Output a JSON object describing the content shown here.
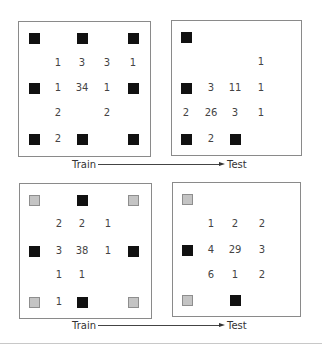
{
  "colors": {
    "black_marker": "#111111",
    "gray_marker": "#c4c4c4",
    "border": "#8a8a8a"
  },
  "rows": [
    {
      "train_label": "Train",
      "test_label": "Test",
      "train": {
        "box": [
          18,
          21,
          133,
          136
        ],
        "cols": [
          34,
          58,
          82,
          107,
          133
        ],
        "rows": [
          38,
          63,
          88,
          113,
          139
        ],
        "cells": [
          [
            "B",
            "",
            "B",
            "",
            "B"
          ],
          [
            "",
            "1",
            "3",
            "3",
            "1"
          ],
          [
            "B",
            "1",
            "34",
            "1",
            "B"
          ],
          [
            "",
            "2",
            "",
            "2",
            ""
          ],
          [
            "B",
            "2",
            "B",
            "",
            "B"
          ]
        ]
      },
      "test": {
        "box": [
          171,
          20,
          131,
          136
        ],
        "cols": [
          186,
          211,
          235,
          261
        ],
        "rows": [
          37,
          62,
          88,
          113,
          139
        ],
        "cells": [
          [
            "B",
            "",
            "",
            ""
          ],
          [
            "",
            "",
            "",
            "1"
          ],
          [
            "B",
            "3",
            "11",
            "1"
          ],
          [
            "2",
            "26",
            "3",
            "1"
          ],
          [
            "B",
            "2",
            "B",
            ""
          ]
        ]
      }
    },
    {
      "train_label": "Train",
      "test_label": "Test",
      "train": {
        "box": [
          19,
          183,
          133,
          136
        ],
        "cols": [
          34,
          59,
          82,
          108,
          133
        ],
        "rows": [
          200,
          224,
          251,
          275,
          302
        ],
        "cells": [
          [
            "G",
            "",
            "B",
            "",
            "G"
          ],
          [
            "",
            "2",
            "2",
            "1",
            ""
          ],
          [
            "B",
            "3",
            "38",
            "1",
            "B"
          ],
          [
            "",
            "1",
            "1",
            "",
            ""
          ],
          [
            "G",
            "1",
            "B",
            "",
            "G"
          ]
        ]
      },
      "test": {
        "box": [
          172,
          182,
          129,
          135
        ],
        "cols": [
          187,
          211,
          235,
          262
        ],
        "rows": [
          199,
          224,
          250,
          275,
          300
        ],
        "cells": [
          [
            "G",
            "",
            "",
            ""
          ],
          [
            "",
            "1",
            "2",
            "2"
          ],
          [
            "B",
            "4",
            "29",
            "3"
          ],
          [
            "",
            "6",
            "1",
            "2"
          ],
          [
            "G",
            "",
            "B",
            ""
          ]
        ]
      }
    }
  ],
  "arrows": [
    {
      "train_x": 72,
      "text_y": 159,
      "line_x1": 98,
      "line_x2": 219,
      "line_y": 164,
      "test_x": 227
    },
    {
      "train_x": 72,
      "text_y": 320,
      "line_x1": 98,
      "line_x2": 219,
      "line_y": 325,
      "test_x": 227
    }
  ]
}
